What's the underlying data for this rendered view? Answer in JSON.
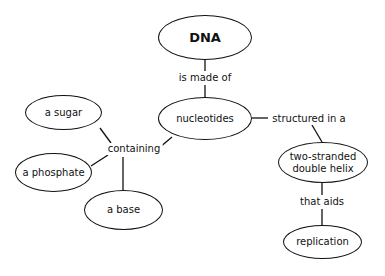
{
  "concept_map": {
    "nodes": {
      "dna": "DNA",
      "nucleotides": "nucleotides",
      "sugar": "a sugar",
      "phosphate": "a phosphate",
      "base": "a base",
      "helix_line1": "two-stranded",
      "helix_line2": "double helix",
      "replication": "replication"
    },
    "links": {
      "is_made_of": "is made of",
      "containing": "containing",
      "structured_in_a": "structured in a",
      "that_aids": "that aids"
    }
  }
}
